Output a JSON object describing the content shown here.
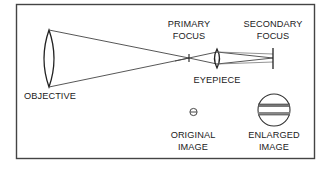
{
  "diagram": {
    "labels": {
      "objective": "OBJECTIVE",
      "primary_focus": [
        "PRIMARY",
        "FOCUS"
      ],
      "secondary_focus": [
        "SECONDARY",
        "FOCUS"
      ],
      "eyepiece": "EYEPIECE",
      "original_image": [
        "ORIGINAL",
        "IMAGE"
      ],
      "enlarged_image": [
        "ENLARGED",
        "IMAGE"
      ]
    },
    "colors": {
      "stroke": "#333333",
      "text": "#222222",
      "background": "#ffffff",
      "band": "#888888"
    }
  }
}
